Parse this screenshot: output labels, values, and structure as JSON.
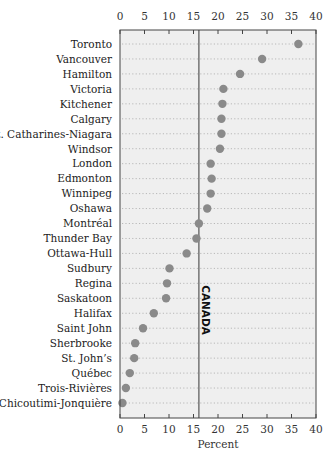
{
  "chart_data": {
    "type": "dot",
    "title": "",
    "xlabel": "Percent",
    "ylabel": "",
    "xlim": [
      0,
      40
    ],
    "x_ticks": [
      0,
      5,
      10,
      15,
      20,
      25,
      30,
      35,
      40
    ],
    "grid": "horizontal dotted row guides",
    "legend": null,
    "reference_line": {
      "label": "CANADA",
      "value": 16.1
    },
    "categories": [
      "Toronto",
      "Vancouver",
      "Hamilton",
      "Victoria",
      "Kitchener",
      "Calgary",
      "St. Catharines-Niagara",
      "Windsor",
      "London",
      "Edmonton",
      "Winnipeg",
      "Oshawa",
      "Montréal",
      "Thunder Bay",
      "Ottawa-Hull",
      "Sudbury",
      "Regina",
      "Saskatoon",
      "Halifax",
      "Saint John",
      "Sherbrooke",
      "St. John’s",
      "Québec",
      "Trois-Rivières",
      "Chicoutimi-Jonquière"
    ],
    "values": [
      36.4,
      29.0,
      24.5,
      21.1,
      20.9,
      20.7,
      20.7,
      20.4,
      18.5,
      18.7,
      18.5,
      17.8,
      16.1,
      15.6,
      13.6,
      10.1,
      9.6,
      9.4,
      6.9,
      4.7,
      3.1,
      2.9,
      2.0,
      1.2,
      0.5
    ]
  },
  "colors": {
    "plot_background": "#efefef",
    "dot": "#8a8a8a",
    "frame": "#444444",
    "reference_line": "#555555",
    "row_guides": "#b8b8b8"
  }
}
